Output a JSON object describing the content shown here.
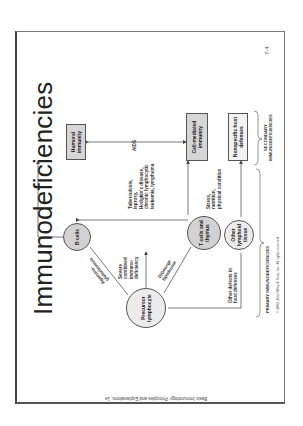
{
  "slide": {
    "title": "Immunodeficiencies",
    "page_number": "7-4",
    "footer": "Basic Immunology: Principles and Explanations, 1e",
    "copyright": "© 2003 John Wiley & Sons, Inc. All rights reserved."
  },
  "nodes": {
    "humoral": "Humoral immunity",
    "cell_mediated": "Cell-mediated immunity",
    "nonspecific": "Nonspecific host defenses",
    "b_cells": "B cells",
    "t_cells": "T cells and thymus",
    "other_lymphoid": "Other lymphoid tissue",
    "precursor": "Precursor lymphocyte"
  },
  "labels": {
    "aids": "AIDS",
    "agamma": "Agamma-\nglobulinemia",
    "scid": "Severe\ncombined\nimmuno-\ndeficiency",
    "digeorge": "DiGeorge\nSyndrome",
    "secondary_causes": "Tuberculosis,\nleprosy,\nHodgkin's disease,\nchronic lymphocytic\nleukemia, lymphoma",
    "stress": "Stress,\nnutrition,\nphysical condition",
    "other_defects": "Other defects in\nhost defenses",
    "primary": "PRIMARY IMMUNODEFICIENCIES",
    "secondary": "SECONDARY\nIMMUNODEFICIENCIES"
  },
  "colors": {
    "box_fill": "#d6d6d6",
    "circle_fill": "#d2d2d2",
    "line": "#555555"
  }
}
